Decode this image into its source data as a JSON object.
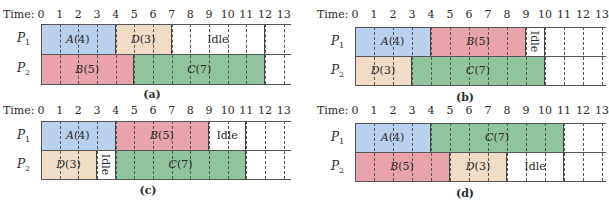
{
  "time_prefix": "Time:",
  "colors": {
    "A": "#b9d0ee",
    "B": "#e8a3ac",
    "C": "#8fc49e",
    "D": "#f1dcc6",
    "Idle": "#ffffff"
  },
  "panels": [
    {
      "id": "a",
      "caption": "(a)",
      "layout": {
        "x0": 41,
        "top": 24,
        "rowH": 30,
        "unit": 18.67,
        "lineEnd": 291,
        "labelY": 9,
        "captionX": 152,
        "captionY": 88
      },
      "ticks": [
        0,
        1,
        2,
        3,
        4,
        5,
        6,
        7,
        8,
        9,
        10,
        11,
        12,
        13
      ],
      "processors": [
        {
          "label": "P",
          "sub": "1",
          "jobs": [
            {
              "name": "A",
              "dur": "4",
              "start": 0,
              "end": 4,
              "color": "A"
            },
            {
              "name": "D",
              "dur": "3",
              "start": 4,
              "end": 7,
              "color": "D"
            },
            {
              "name": "Idle",
              "dur": "",
              "start": 7,
              "end": 12,
              "color": "Idle",
              "rotated": false
            }
          ]
        },
        {
          "label": "P",
          "sub": "2",
          "jobs": [
            {
              "name": "B",
              "dur": "5",
              "start": 0,
              "end": 5,
              "color": "B"
            },
            {
              "name": "C",
              "dur": "7",
              "start": 5,
              "end": 12,
              "color": "C"
            }
          ]
        }
      ]
    },
    {
      "id": "b",
      "caption": "(b)",
      "layout": {
        "x0": 355,
        "top": 27,
        "rowH": 29,
        "unit": 19,
        "lineEnd": 606,
        "labelY": 9,
        "captionX": 465,
        "captionY": 91
      },
      "ticks": [
        0,
        1,
        2,
        3,
        4,
        5,
        6,
        7,
        8,
        9,
        10,
        11,
        12,
        13
      ],
      "processors": [
        {
          "label": "P",
          "sub": "1",
          "jobs": [
            {
              "name": "A",
              "dur": "4",
              "start": 0,
              "end": 4,
              "color": "A"
            },
            {
              "name": "B",
              "dur": "5",
              "start": 4,
              "end": 9,
              "color": "B"
            },
            {
              "name": "Idle",
              "dur": "",
              "start": 9,
              "end": 10,
              "color": "Idle",
              "rotated": true
            }
          ]
        },
        {
          "label": "P",
          "sub": "2",
          "jobs": [
            {
              "name": "D",
              "dur": "3",
              "start": 0,
              "end": 3,
              "color": "D"
            },
            {
              "name": "C",
              "dur": "7",
              "start": 3,
              "end": 10,
              "color": "C"
            }
          ]
        }
      ]
    },
    {
      "id": "c",
      "caption": "(c)",
      "layout": {
        "x0": 41,
        "top": 121,
        "rowH": 29,
        "unit": 18.67,
        "lineEnd": 291,
        "labelY": 105,
        "captionX": 148,
        "captionY": 184
      },
      "ticks": [
        0,
        1,
        2,
        3,
        4,
        5,
        6,
        7,
        8,
        9,
        10,
        11,
        12,
        13
      ],
      "processors": [
        {
          "label": "P",
          "sub": "1",
          "jobs": [
            {
              "name": "A",
              "dur": "4",
              "start": 0,
              "end": 4,
              "color": "A"
            },
            {
              "name": "B",
              "dur": "5",
              "start": 4,
              "end": 9,
              "color": "B"
            },
            {
              "name": "Idle",
              "dur": "",
              "start": 9,
              "end": 11,
              "color": "Idle",
              "rotated": false
            }
          ]
        },
        {
          "label": "P",
          "sub": "2",
          "jobs": [
            {
              "name": "D",
              "dur": "3",
              "start": 0,
              "end": 3,
              "color": "D"
            },
            {
              "name": "Idle",
              "dur": "",
              "start": 3,
              "end": 4,
              "color": "Idle",
              "rotated": true
            },
            {
              "name": "C",
              "dur": "7",
              "start": 4,
              "end": 11,
              "color": "C"
            }
          ]
        }
      ]
    },
    {
      "id": "d",
      "caption": "(d)",
      "layout": {
        "x0": 355,
        "top": 123,
        "rowH": 29,
        "unit": 19,
        "lineEnd": 606,
        "labelY": 105,
        "captionX": 465,
        "captionY": 187
      },
      "ticks": [
        0,
        1,
        2,
        3,
        4,
        5,
        6,
        7,
        8,
        9,
        10,
        11,
        12,
        13
      ],
      "processors": [
        {
          "label": "P",
          "sub": "1",
          "jobs": [
            {
              "name": "A",
              "dur": "4",
              "start": 0,
              "end": 4,
              "color": "A"
            },
            {
              "name": "C",
              "dur": "7",
              "start": 4,
              "end": 11,
              "color": "C"
            }
          ]
        },
        {
          "label": "P",
          "sub": "2",
          "jobs": [
            {
              "name": "B",
              "dur": "5",
              "start": 0,
              "end": 5,
              "color": "B"
            },
            {
              "name": "D",
              "dur": "3",
              "start": 5,
              "end": 8,
              "color": "D"
            },
            {
              "name": "Idle",
              "dur": "",
              "start": 8,
              "end": 11,
              "color": "Idle",
              "rotated": false
            }
          ]
        }
      ]
    }
  ]
}
